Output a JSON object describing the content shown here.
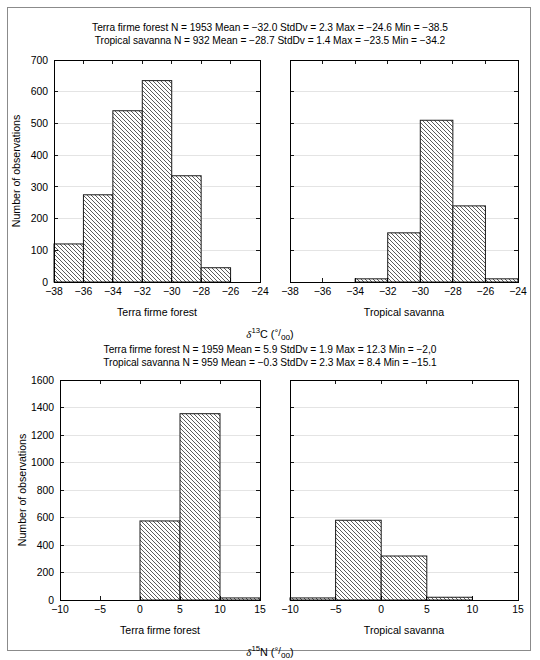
{
  "figure": {
    "border_color": "#8b8b8b",
    "background": "#ffffff",
    "bar_fill": "#ffffff",
    "bar_edge": "#1a1a1a",
    "hatch": "diagonal-backslash",
    "grid_color": "#d9d9d9"
  },
  "panels": [
    {
      "id": "delta13C",
      "stats": [
        "Terra firme forest N = 1953 Mean = −32.0 StdDv = 2.3 Max = −24.6 Min = −38.5",
        "Tropical savanna N = 932 Mean = −28.7 StdDv = 1.4 Max = −23.5 Min = −34.2"
      ],
      "ylabel": "Number of observations",
      "xaxis_title_parts": {
        "delta": "δ",
        "mass": "13",
        "element": "C",
        "unit_open": "(",
        "permil_num": "°/",
        "permil_den": "oo",
        "unit_close": ")"
      },
      "left_group_label": "Terra firme forest",
      "right_group_label": "Tropical savanna"
    },
    {
      "id": "delta15N",
      "stats": [
        "Terra firme forest N = 1959 Mean = 5.9 StdDv = 1.9 Max = 12.3 Min = −2,0",
        "Tropical savanna N = 959 Mean = −0.3 StdDv = 2.3 Max = 8.4 Min = −15.1"
      ],
      "ylabel": "Number of observations",
      "xaxis_title_parts": {
        "delta": "δ",
        "mass": "15",
        "element": "N",
        "unit_open": "(",
        "permil_num": "°/",
        "permil_den": "oo",
        "unit_close": ")"
      },
      "left_group_label": "Terra firme forest",
      "right_group_label": "Tropical savanna"
    }
  ],
  "chart_data": [
    {
      "type": "bar",
      "id": "c13-terra-firme-forest",
      "title": "Terra firme forest",
      "subtitle": "δ13C histogram",
      "xlabel": "Terra firme forest",
      "ylabel": "Number of observations",
      "xlim": [
        -38,
        -24
      ],
      "ylim": [
        0,
        700
      ],
      "xticks": [
        -38,
        -36,
        -34,
        -32,
        -30,
        -28,
        -26,
        -24
      ],
      "xticklabels": [
        "−38",
        "−36",
        "−34",
        "−32",
        "−30",
        "−28",
        "−26",
        "−24"
      ],
      "yticks": [
        0,
        100,
        200,
        300,
        400,
        500,
        600,
        700
      ],
      "yticklabels": [
        "0",
        "100",
        "200",
        "300",
        "400",
        "500",
        "600",
        "700"
      ],
      "bin_edges": [
        -38,
        -36,
        -34,
        -32,
        -30,
        -28,
        -26,
        -24
      ],
      "categories": [
        "−38 to −36",
        "−36 to −34",
        "−34 to −32",
        "−32 to −30",
        "−30 to −28",
        "−28 to −26",
        "−26 to −24"
      ],
      "values": [
        120,
        275,
        540,
        635,
        335,
        45,
        0
      ],
      "grid": true,
      "legend": "none"
    },
    {
      "type": "bar",
      "id": "c13-tropical-savanna",
      "title": "Tropical savanna",
      "subtitle": "δ13C histogram",
      "xlabel": "Tropical savanna",
      "ylabel": "",
      "xlim": [
        -38,
        -24
      ],
      "ylim": [
        0,
        700
      ],
      "xticks": [
        -38,
        -36,
        -34,
        -32,
        -30,
        -28,
        -26,
        -24
      ],
      "xticklabels": [
        "−38",
        "−36",
        "−34",
        "−32",
        "−30",
        "−28",
        "−26",
        "−24"
      ],
      "yticks": [
        0,
        100,
        200,
        300,
        400,
        500,
        600,
        700
      ],
      "yticklabels": [
        "",
        "",
        "",
        "",
        "",
        "",
        "",
        ""
      ],
      "bin_edges": [
        -38,
        -36,
        -34,
        -32,
        -30,
        -28,
        -26,
        -24
      ],
      "categories": [
        "−38 to −36",
        "−36 to −34",
        "−34 to −32",
        "−32 to −30",
        "−30 to −28",
        "−28 to −26",
        "−26 to −24"
      ],
      "values": [
        0,
        0,
        10,
        155,
        510,
        240,
        10
      ],
      "grid": true,
      "legend": "none"
    },
    {
      "type": "bar",
      "id": "n15-terra-firme-forest",
      "title": "Terra firme forest",
      "subtitle": "δ15N histogram",
      "xlabel": "Terra firme forest",
      "ylabel": "Number of observations",
      "xlim": [
        -10,
        15
      ],
      "ylim": [
        0,
        1600
      ],
      "xticks": [
        -10,
        -5,
        0,
        5,
        10,
        15
      ],
      "xticklabels": [
        "−10",
        "−5",
        "0",
        "5",
        "10",
        "15"
      ],
      "yticks": [
        0,
        200,
        400,
        600,
        800,
        1000,
        1200,
        1400,
        1600
      ],
      "yticklabels": [
        "0",
        "200",
        "400",
        "600",
        "800",
        "1000",
        "1200",
        "1400",
        "1600"
      ],
      "bin_edges": [
        -10,
        -5,
        0,
        5,
        10,
        15
      ],
      "categories": [
        "−10 to −5",
        "−5 to 0",
        "0 to 5",
        "5 to 10",
        "10 to 15"
      ],
      "values": [
        0,
        0,
        575,
        1355,
        15
      ],
      "grid": true,
      "legend": "none"
    },
    {
      "type": "bar",
      "id": "n15-tropical-savanna",
      "title": "Tropical savanna",
      "subtitle": "δ15N histogram",
      "xlabel": "Tropical savanna",
      "ylabel": "",
      "xlim": [
        -10,
        15
      ],
      "ylim": [
        0,
        1600
      ],
      "xticks": [
        -10,
        -5,
        0,
        5,
        10,
        15
      ],
      "xticklabels": [
        "−10",
        "−5",
        "0",
        "5",
        "10",
        "15"
      ],
      "yticks": [
        0,
        200,
        400,
        600,
        800,
        1000,
        1200,
        1400,
        1600
      ],
      "yticklabels": [
        "",
        "",
        "",
        "",
        "",
        "",
        "",
        "",
        ""
      ],
      "bin_edges": [
        -10,
        -5,
        0,
        5,
        10,
        15
      ],
      "categories": [
        "−10 to −5",
        "−5 to 0",
        "0 to 5",
        "5 to 10",
        "10 to 15"
      ],
      "values": [
        15,
        580,
        320,
        20,
        0
      ],
      "grid": true,
      "legend": "none"
    }
  ]
}
